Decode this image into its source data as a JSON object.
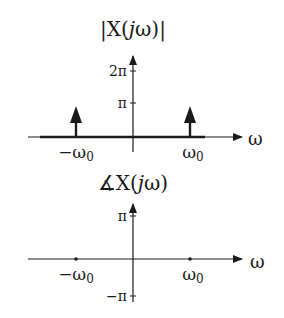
{
  "figure": {
    "magnitude_plot": {
      "title_prefix": "|X(",
      "title_j": "j",
      "title_suffix": "ω)|",
      "y_ticks": [
        {
          "label": "2π",
          "value": "2pi"
        },
        {
          "label": "π",
          "value": "pi"
        }
      ],
      "x_axis_label": "ω",
      "x_marks": [
        {
          "label_main": "−ω",
          "label_sub": "0"
        },
        {
          "label_main": "ω",
          "label_sub": "0"
        }
      ],
      "impulses": [
        {
          "at": "-omega0",
          "height": "pi"
        },
        {
          "at": "omega0",
          "height": "pi"
        }
      ]
    },
    "phase_plot": {
      "title_angle": "∡",
      "title_prefix": "X(",
      "title_j": "j",
      "title_suffix": "ω)",
      "y_ticks": [
        {
          "label": "π",
          "value": "pi"
        },
        {
          "label": "−π",
          "value": "-pi"
        }
      ],
      "x_axis_label": "ω",
      "x_marks": [
        {
          "label_main": "−ω",
          "label_sub": "0"
        },
        {
          "label_main": "ω",
          "label_sub": "0"
        }
      ],
      "points": [
        {
          "at": "-omega0",
          "value": 0
        },
        {
          "at": "omega0",
          "value": 0
        }
      ]
    },
    "colors": {
      "ink": "#1a1a1a",
      "background": "#ffffff"
    }
  }
}
